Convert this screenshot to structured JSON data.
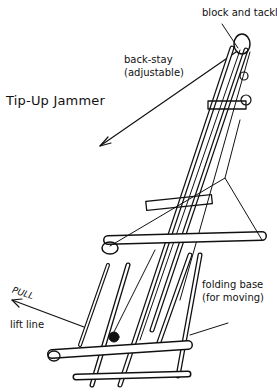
{
  "title": "Tip-Up Jammer",
  "labels": {
    "block_and_tackle": "block and tackle",
    "back_stay_line1": "back-stay",
    "back_stay_line2": "(adjustable)",
    "folding_base_line1": "folding base",
    "folding_base_line2": "(for moving)",
    "pull": "PULL",
    "lift_line": "lift line"
  },
  "colors": {
    "ink": "#111111",
    "background": "#ffffff"
  }
}
